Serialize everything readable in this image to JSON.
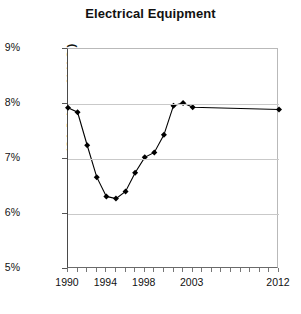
{
  "chart_data": {
    "type": "line",
    "title": "Electrical Equipment",
    "xlabel": "",
    "ylabel": "(CA Jobs as % U.S.)",
    "xlim": [
      1990,
      2012
    ],
    "ylim": [
      5,
      9
    ],
    "ytick_labels": [
      "9%",
      "8%",
      "7%",
      "6%",
      "5%"
    ],
    "ytick_values": [
      9,
      8,
      7,
      6,
      5
    ],
    "xtick_labels": [
      "1990",
      "1994",
      "1998",
      "2003",
      "2012"
    ],
    "xtick_values": [
      1990,
      1994,
      1998,
      2003,
      2012
    ],
    "grid": true,
    "legend": "none",
    "marker": "diamond",
    "line_color": "#000000",
    "marker_color": "#000000",
    "x": [
      1990,
      1991,
      1992,
      1993,
      1994,
      1995,
      1996,
      1997,
      1998,
      1999,
      2000,
      2001,
      2002,
      2003,
      2012
    ],
    "values": [
      7.93,
      7.85,
      7.25,
      6.67,
      6.32,
      6.28,
      6.41,
      6.75,
      7.03,
      7.12,
      7.44,
      7.97,
      8.02,
      7.94,
      7.9
    ],
    "series": [
      {
        "name": "CA Jobs as % U.S.",
        "values": [
          7.93,
          7.85,
          7.25,
          6.67,
          6.32,
          6.28,
          6.41,
          6.75,
          7.03,
          7.12,
          7.44,
          7.97,
          8.02,
          7.94,
          7.9
        ]
      }
    ]
  },
  "chart": {
    "title": "Electrical Equipment",
    "y_axis_title": "(CA Jobs as % U.S.)"
  }
}
